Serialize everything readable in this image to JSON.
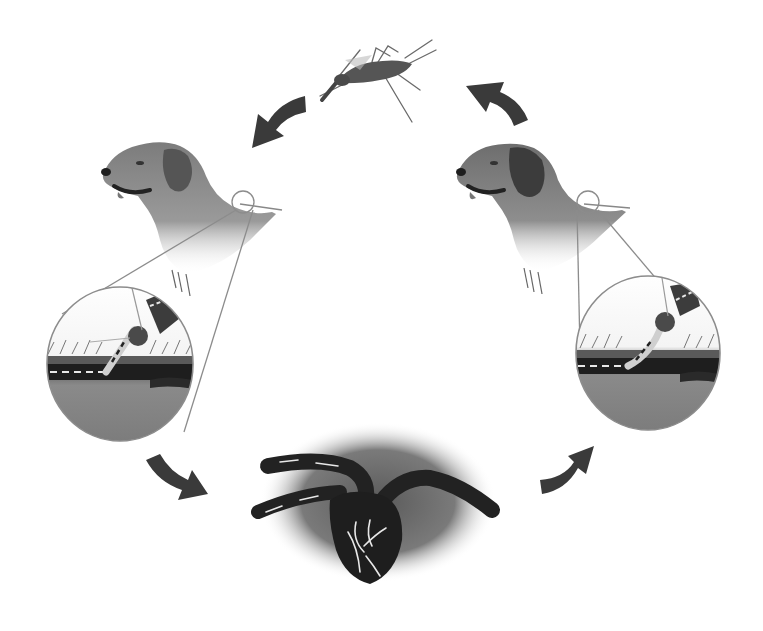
{
  "diagram": {
    "title": "Heartworm life cycle",
    "colors": {
      "background": "#ffffff",
      "arrow": "#3a3a3a",
      "dog_light": "#8a8a8a",
      "dog_dark": "#3c3c3c",
      "vessel": "#2a2a2a",
      "heart": "#1e1e1e",
      "worm": "#e8e8e8",
      "lens_outline": "#8c8c8c"
    },
    "nodes": [
      {
        "id": "mosquito",
        "label": "Mosquito (vector)",
        "position": "top-center"
      },
      {
        "id": "dog-left",
        "label": "Dog (infected host)",
        "position": "left"
      },
      {
        "id": "bite-detail-left",
        "label": "Mosquito bite magnified: microfilariae in blood vessel",
        "position": "left-lower"
      },
      {
        "id": "heart",
        "label": "Heart with adult heartworms",
        "position": "bottom-center"
      },
      {
        "id": "dog-right",
        "label": "Dog (new host)",
        "position": "right"
      },
      {
        "id": "bite-detail-right",
        "label": "Mosquito bite magnified: larvae entering skin",
        "position": "right-lower"
      }
    ],
    "arrows": [
      {
        "from": "mosquito",
        "to": "dog-left",
        "direction": "down-left"
      },
      {
        "from": "bite-detail-left",
        "to": "heart",
        "direction": "down-right"
      },
      {
        "from": "heart",
        "to": "dog-right",
        "direction": "up-right"
      },
      {
        "from": "dog-right",
        "to": "mosquito",
        "direction": "up-left"
      }
    ]
  }
}
